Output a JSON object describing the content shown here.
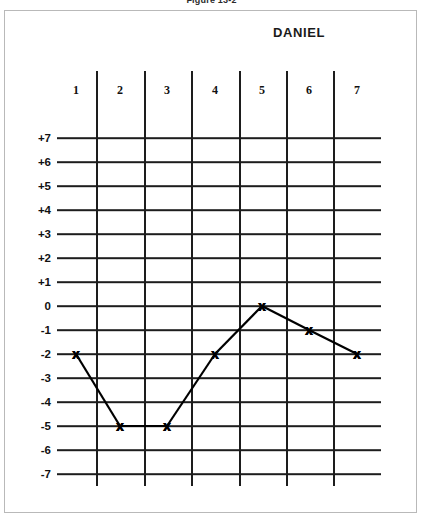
{
  "figure": {
    "caption": "Figure 13-2"
  },
  "student": {
    "name": "DANIEL"
  },
  "chart_data": {
    "type": "line",
    "title": "DANIEL",
    "xlabel": "",
    "ylabel": "",
    "categories": [
      "1",
      "2",
      "3",
      "4",
      "5",
      "6",
      "7"
    ],
    "values": [
      -2,
      -5,
      -5,
      -2,
      0,
      -1,
      -2
    ],
    "series": [
      {
        "name": "DANIEL",
        "values": [
          -2,
          -5,
          -5,
          -2,
          0,
          -1,
          -2
        ]
      }
    ],
    "ylim": [
      -7,
      7
    ],
    "y_ticks": [
      "+7",
      "+6",
      "+5",
      "+4",
      "+3",
      "+2",
      "+1",
      "0",
      "-1",
      "-2",
      "-3",
      "-4",
      "-5",
      "-6",
      "-7"
    ],
    "x_ticks": [
      "1",
      "2",
      "3",
      "4",
      "5",
      "6",
      "7"
    ],
    "grid": true,
    "legend": "none",
    "marker": "x",
    "line_color": "#000000"
  },
  "axis": {
    "y_labels": [
      "+7",
      "+6",
      "+5",
      "+4",
      "+3",
      "+2",
      "+1",
      "0",
      "-1",
      "-2",
      "-3",
      "-4",
      "-5",
      "-6",
      "-7"
    ],
    "x_labels": [
      "1",
      "2",
      "3",
      "4",
      "5",
      "6",
      "7"
    ]
  },
  "colors": {
    "ink": "#1d1d1d",
    "frame": "#b9b9b9",
    "background": "#ffffff"
  }
}
